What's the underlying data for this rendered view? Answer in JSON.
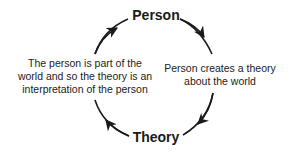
{
  "diagram": {
    "type": "cycle",
    "nodes": [
      {
        "id": "person",
        "label": "Person"
      },
      {
        "id": "theory",
        "label": "Theory"
      }
    ],
    "edges": [
      {
        "from": "person",
        "to": "theory",
        "label": "Person creates a theory about the world"
      },
      {
        "from": "theory",
        "to": "person",
        "label": "The person is part of the world and so the theory is an interpretation of the person"
      }
    ],
    "right_label_lines": [
      "Person creates a theory",
      "about the world"
    ],
    "left_label_lines": [
      "The person is part of the",
      "world and so the theory is an",
      "interpretation of the person"
    ],
    "stroke_color": "#1a1a1a"
  }
}
